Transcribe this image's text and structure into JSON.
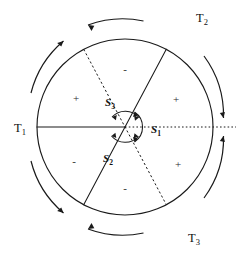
{
  "figure": {
    "background_color": "#ffffff",
    "ink_color": "#1a1a1a"
  },
  "geometry": {
    "center": {
      "x": 125,
      "y": 127
    },
    "radius": 88,
    "lines": [
      {
        "id": "line-horizontal",
        "angle_deg": 0,
        "left_style": "solid",
        "right_style": "dotted",
        "right_extends_beyond_circle": true,
        "right_extent_x": 236
      },
      {
        "id": "line-ne-sw",
        "angle_deg": 62,
        "style": "solid"
      },
      {
        "id": "line-nw-se",
        "angle_deg": 118,
        "style": "dashed"
      }
    ]
  },
  "axis_labels": [
    {
      "name": "T1",
      "base": "T",
      "sub": "1",
      "x": 14,
      "y": 132
    },
    {
      "name": "T2",
      "base": "T",
      "sub": "2",
      "x": 196,
      "y": 22
    },
    {
      "name": "T3",
      "base": "T",
      "sub": "3",
      "x": 188,
      "y": 242
    }
  ],
  "rotation_labels": [
    {
      "name": "S1",
      "base": "S",
      "sub": "1",
      "x": 151,
      "y": 133
    },
    {
      "name": "S2",
      "base": "S",
      "sub": "2",
      "x": 103,
      "y": 162
    },
    {
      "name": "S3",
      "base": "S",
      "sub": "3",
      "x": 105,
      "y": 106
    }
  ],
  "sector_signs": [
    {
      "name": "sign-top",
      "symbol": "-",
      "x": 125,
      "y": 73
    },
    {
      "name": "sign-upper-right",
      "symbol": "+",
      "x": 176,
      "y": 103
    },
    {
      "name": "sign-lower-right",
      "symbol": "+",
      "x": 178,
      "y": 168
    },
    {
      "name": "sign-bottom",
      "symbol": "-",
      "x": 125,
      "y": 192
    },
    {
      "name": "sign-lower-left",
      "symbol": "-",
      "x": 74,
      "y": 165
    },
    {
      "name": "sign-upper-left",
      "symbol": "+",
      "x": 76,
      "y": 102
    }
  ],
  "outer_arcs": [
    {
      "name": "arc-T1-upper",
      "direction": "counterclockwise"
    },
    {
      "name": "arc-T2-top",
      "direction": "counterclockwise"
    },
    {
      "name": "arc-T2-right",
      "direction": "counterclockwise"
    },
    {
      "name": "arc-T3-right",
      "direction": "counterclockwise"
    },
    {
      "name": "arc-T3-bottom",
      "direction": "counterclockwise"
    },
    {
      "name": "arc-T1-lower",
      "direction": "counterclockwise"
    }
  ],
  "inner_arcs": [
    {
      "name": "inner-arc-S1",
      "direction": "counterclockwise"
    },
    {
      "name": "inner-arc-S2",
      "direction": "counterclockwise"
    },
    {
      "name": "inner-arc-S3",
      "direction": "counterclockwise"
    }
  ]
}
